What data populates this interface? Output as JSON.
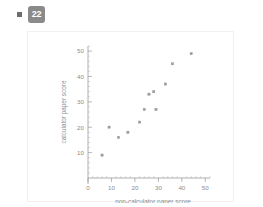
{
  "header": {
    "bullet_icon": "square-bullet-icon",
    "question_number": "22"
  },
  "chart_data": {
    "type": "scatter",
    "title": "",
    "xlabel": "non-calculator paper score",
    "ylabel": "calculator paper score",
    "xlim": [
      0,
      52
    ],
    "ylim": [
      0,
      52
    ],
    "xticks": [
      0,
      10,
      20,
      30,
      40,
      50
    ],
    "yticks": [
      10,
      20,
      30,
      40,
      50
    ],
    "xtick_labels": [
      "0",
      "10",
      "20",
      "30",
      "40",
      "50"
    ],
    "ytick_labels": [
      "10",
      "20",
      "30",
      "40",
      "50"
    ],
    "grid": false,
    "legend": false,
    "marker": "square",
    "marker_color": "#9b9b9b",
    "points": [
      {
        "x": 6,
        "y": 9
      },
      {
        "x": 9,
        "y": 20
      },
      {
        "x": 13,
        "y": 16
      },
      {
        "x": 17,
        "y": 18
      },
      {
        "x": 22,
        "y": 22
      },
      {
        "x": 24,
        "y": 27
      },
      {
        "x": 26,
        "y": 33
      },
      {
        "x": 28,
        "y": 34
      },
      {
        "x": 29,
        "y": 27
      },
      {
        "x": 33,
        "y": 37
      },
      {
        "x": 36,
        "y": 45
      },
      {
        "x": 44,
        "y": 49
      }
    ]
  },
  "colors": {
    "badge_background": "#8a8a8a",
    "badge_text": "#ffffff",
    "axis": "#9a9a9a",
    "text": "#8c8c8c",
    "card_border": "#f0f0f0",
    "page_background": "#ffffff"
  }
}
